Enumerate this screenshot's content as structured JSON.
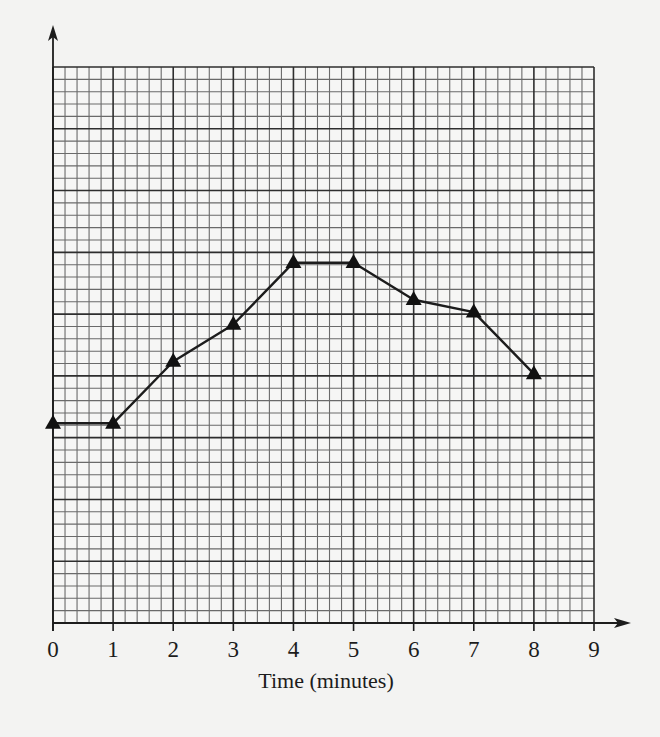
{
  "chart_data": {
    "type": "line",
    "title": "",
    "xlabel": "Time (minutes)",
    "ylabel": "",
    "x_ticks": [
      "0",
      "1",
      "2",
      "3",
      "4",
      "5",
      "6",
      "7",
      "8",
      "9"
    ],
    "xlim": [
      0,
      9
    ],
    "ylim": [
      0,
      45
    ],
    "y_units_note": "y-axis unlabeled; values given in small grid squares from the x-axis",
    "grid": {
      "on": true,
      "minor_per_major": 5,
      "x_minor_cells": 45,
      "y_minor_cells": 45
    },
    "marker": "triangle",
    "series": [
      {
        "name": "",
        "x": [
          0,
          1,
          2,
          3,
          4,
          5,
          6,
          7,
          8
        ],
        "values": [
          16,
          16,
          21,
          24,
          29,
          29,
          26,
          25,
          20
        ]
      }
    ],
    "legend": null
  },
  "colors": {
    "background": "#f3f3f2",
    "grid_minor": "#6a6a6a",
    "grid_major": "#2e2e2e",
    "axis": "#1c1c1c",
    "line": "#1c1c1c",
    "marker": "#111111"
  }
}
